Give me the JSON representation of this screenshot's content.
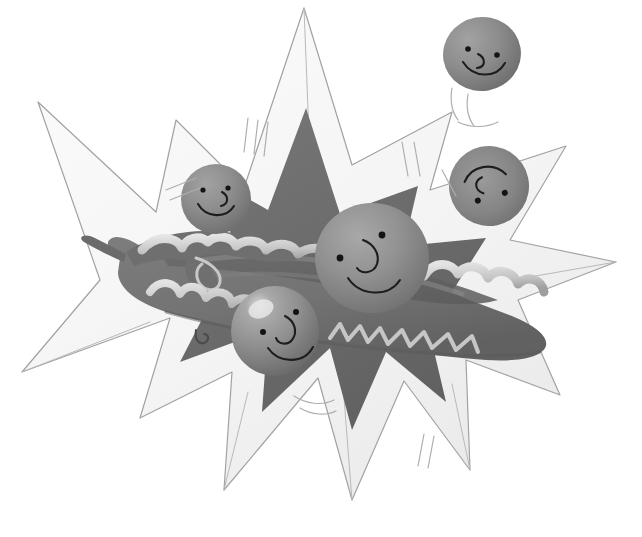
{
  "artwork": {
    "title": "Peas bursting from a pea pod",
    "medium": "children's book illustration, grayscale",
    "background_color": "#ffffff"
  },
  "palette": {
    "background": "#ffffff",
    "outer_star_fill": "#f7f7f7",
    "outer_star_shade": "#ededed",
    "outer_star_outline": "#a2a2a2",
    "inner_star_fill": "#6e6e6e",
    "inner_star_shade": "#606060",
    "pod_fill": "#737373",
    "pod_dark": "#606060",
    "pod_rim": "#cfcfcf",
    "pod_rim_shade": "#a8a8a8",
    "pea_fill": "#8b8b8b",
    "pea_light": "#a6a6a6",
    "pea_highlight": "#e2e2e2",
    "pea_shadow": "#6a6a6a",
    "face_ink": "#1d1d1d",
    "pencil": "#9a9a9a"
  },
  "scene": {
    "outer_star": {
      "name": "outer-pale-starburst",
      "points": 7,
      "fill": "#f7f7f7",
      "outline": "#a2a2a2"
    },
    "inner_star": {
      "name": "inner-dark-starburst",
      "points": 6,
      "fill": "#6e6e6e"
    },
    "pod": {
      "name": "pea-pod",
      "fill": "#737373",
      "has_curled_stem": true,
      "stem_side": "left",
      "torn_edge": "scalloped",
      "split_open": true
    }
  },
  "peas": [
    {
      "id": "pea-center",
      "label": "Center pea",
      "position": "center",
      "cx": 372,
      "cy": 258,
      "rx": 57,
      "ry": 55,
      "rotation": 0,
      "size": "large",
      "expression": "smiling",
      "eyes": 2,
      "has_nose": true,
      "has_highlight": false
    },
    {
      "id": "pea-top-left",
      "label": "Upper-left pea",
      "position": "upper-left",
      "cx": 216,
      "cy": 199,
      "rx": 35,
      "ry": 35,
      "rotation": -6,
      "size": "medium",
      "expression": "smiling",
      "eyes": 2,
      "has_nose": true,
      "has_highlight": false
    },
    {
      "id": "pea-bottom",
      "label": "Lower-center pea",
      "position": "lower-center",
      "cx": 275,
      "cy": 331,
      "rx": 44,
      "ry": 45,
      "rotation": 4,
      "size": "medium",
      "expression": "smiling",
      "eyes": 2,
      "has_nose": true,
      "has_highlight": true
    },
    {
      "id": "pea-right",
      "label": "Right tumbling pea",
      "position": "right",
      "cx": 489,
      "cy": 186,
      "rx": 40,
      "ry": 40,
      "rotation": 168,
      "size": "medium",
      "expression": "smiling",
      "eyes": 2,
      "has_nose": true,
      "has_highlight": false
    },
    {
      "id": "pea-flying",
      "label": "Flying pea, top right",
      "position": "top-right",
      "cx": 482,
      "cy": 54,
      "rx": 39,
      "ry": 37,
      "rotation": -10,
      "size": "medium",
      "expression": "smiling",
      "eyes": 2,
      "has_nose": true,
      "has_highlight": false,
      "has_motion_trail": true
    }
  ],
  "motion_marks": {
    "name": "speed-lines",
    "count": 5,
    "color": "#aeaeae",
    "locations": [
      "below-flying-pea",
      "upper-left-of-star",
      "upper-right-of-star",
      "below-star",
      "right-of-center"
    ]
  }
}
